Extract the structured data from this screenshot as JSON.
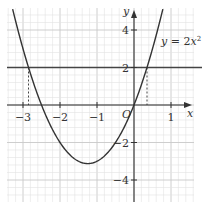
{
  "diagram": {
    "type": "function-graph",
    "curve_label": "y = 2x²",
    "curve_label_parts": {
      "lhs": "y",
      "eq": " = 2",
      "var": "x",
      "exp": "2"
    },
    "horizontal_line": {
      "y": 2
    },
    "x_axis_label": "x",
    "y_axis_label": "y",
    "origin_label": "O",
    "x_ticks": [
      {
        "value": -3,
        "label": "−3"
      },
      {
        "value": -2,
        "label": "−2"
      },
      {
        "value": -1,
        "label": "−1"
      },
      {
        "value": 1,
        "label": "1"
      }
    ],
    "y_ticks": [
      {
        "value": 4,
        "label": "4"
      },
      {
        "value": 2,
        "label": "2"
      },
      {
        "value": -2,
        "label": "−2"
      },
      {
        "value": -4,
        "label": "−4"
      }
    ],
    "intersections_x": [
      -2.85,
      0.35
    ],
    "colors": {
      "grid_minor": "#e3e3e3",
      "grid_major": "#c8c8c8",
      "axis": "#333333",
      "curve": "#333333"
    }
  }
}
